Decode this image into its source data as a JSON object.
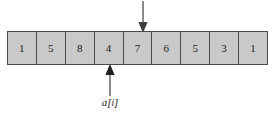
{
  "figure": {
    "type": "array-diagram",
    "colors": {
      "cell_fill": "#c9c9c9",
      "cell_border": "#4a4a4a",
      "text": "#1b1b1b",
      "arrow": "#4a4a4a",
      "background": "#ffffff"
    }
  },
  "array": {
    "name": "a",
    "length": 9,
    "cells": [
      {
        "index": 0,
        "value": "1"
      },
      {
        "index": 1,
        "value": "5"
      },
      {
        "index": 2,
        "value": "8"
      },
      {
        "index": 3,
        "value": "4"
      },
      {
        "index": 4,
        "value": "7"
      },
      {
        "index": 5,
        "value": "6"
      },
      {
        "index": 6,
        "value": "5"
      },
      {
        "index": 7,
        "value": "3"
      },
      {
        "index": 8,
        "value": "1"
      }
    ]
  },
  "annotations": {
    "top_arrow": {
      "direction": "down",
      "target_cell_index": 4,
      "target_value": "7",
      "label": ""
    },
    "bottom_arrow": {
      "direction": "up",
      "target_cell_index": 3,
      "target_value": "4",
      "label": "a[i]",
      "label_base": "a",
      "label_open_bracket": "[",
      "label_subscript": "i",
      "label_close_bracket": "]"
    }
  }
}
